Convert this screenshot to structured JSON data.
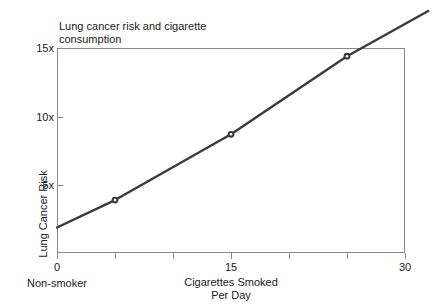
{
  "chart_data": {
    "type": "line",
    "title": "Lung cancer risk and cigarette\nconsumption",
    "xlabel": "Cigarettes Smoked\nPer Day",
    "ylabel": "Lung Cancer Risk",
    "xlim": [
      0,
      30
    ],
    "ylim": [
      0,
      15
    ],
    "grid": false,
    "legend": "none",
    "x_tick_labels": [
      "0",
      "15",
      "30"
    ],
    "x_tick_values": [
      0,
      15,
      30
    ],
    "x_minor_tick_values": [
      5,
      10,
      20,
      25
    ],
    "y_tick_labels": [
      "15x",
      "10x",
      "5x"
    ],
    "y_tick_values": [
      15,
      10,
      5
    ],
    "x_sublabel": "Non-smoker",
    "series": [
      {
        "name": "Lung cancer risk",
        "x": [
          0,
          5,
          15,
          25,
          32
        ],
        "values": [
          1.9,
          3.9,
          8.7,
          14.4,
          17.7
        ],
        "marker_x": [
          5,
          15,
          25
        ],
        "marker_values": [
          3.9,
          8.7,
          14.4
        ],
        "color": "#3a3a3a",
        "line_width": 2.4
      }
    ],
    "annotations": []
  },
  "style": {
    "frame_color": "#8a8a8a",
    "text_color": "#1a1a1a",
    "background": "#ffffff"
  }
}
